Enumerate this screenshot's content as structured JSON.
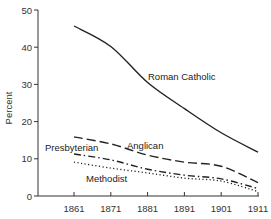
{
  "chart_data": {
    "type": "line",
    "title": "",
    "xlabel": "",
    "ylabel": "Percent",
    "x": [
      1861,
      1871,
      1881,
      1891,
      1901,
      1911
    ],
    "x_tick_labels": [
      "1861",
      "1871",
      "1881",
      "1891",
      "1901",
      "1911"
    ],
    "y_tick_labels": [
      "0",
      "10",
      "20",
      "30",
      "40",
      "50"
    ],
    "ylim": [
      0,
      50
    ],
    "grid": false,
    "legend": "inline labels",
    "series": [
      {
        "name": "Roman Catholic",
        "style": "solid",
        "values": [
          45.7,
          40.2,
          30.5,
          23.5,
          17.0,
          11.8
        ]
      },
      {
        "name": "Anglican",
        "style": "dashed",
        "values": [
          15.9,
          14.0,
          11.0,
          9.1,
          8.0,
          3.6
        ]
      },
      {
        "name": "Presbyterian",
        "style": "dash-dot",
        "values": [
          11.3,
          9.7,
          7.2,
          5.6,
          4.6,
          2.0
        ]
      },
      {
        "name": "Methodist",
        "style": "dotted",
        "values": [
          9.1,
          7.5,
          6.2,
          4.8,
          4.0,
          1.2
        ]
      }
    ]
  }
}
